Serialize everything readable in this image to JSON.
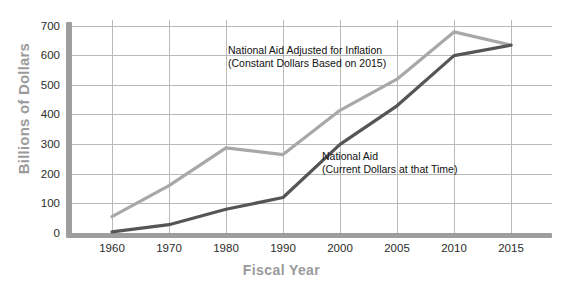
{
  "chart_data": {
    "type": "line",
    "title": "",
    "xlabel": "Fiscal Year",
    "ylabel": "Billions of Dollars",
    "categories": [
      "1960",
      "1970",
      "1980",
      "1990",
      "2000",
      "2005",
      "2010",
      "2015"
    ],
    "ylim": [
      0,
      700
    ],
    "yticks": [
      "0",
      "100",
      "200",
      "300",
      "400",
      "500",
      "600",
      "700"
    ],
    "grid": "both",
    "legend": "inline-annotations",
    "series": [
      {
        "name": "National Aid Adjusted for Inflation (Constant Dollars Based on 2015)",
        "color": "#a8a8a8",
        "values": [
          55,
          160,
          288,
          265,
          415,
          520,
          680,
          635
        ]
      },
      {
        "name": "National Aid (Current Dollars at that Time)",
        "color": "#555555",
        "values": [
          4,
          28,
          80,
          120,
          300,
          430,
          600,
          635
        ]
      }
    ],
    "annotations": [
      {
        "name": "inflation-series-label",
        "line1": "National Aid Adjusted for Inflation",
        "line2": "(Constant Dollars Based on 2015)"
      },
      {
        "name": "current-series-label",
        "line1": "National Aid",
        "line2": "(Current Dollars at that Time)"
      }
    ]
  },
  "axis": {
    "y_title": "Billions of Dollars",
    "x_title": "Fiscal Year",
    "yticks": [
      "700",
      "600",
      "500",
      "400",
      "300",
      "200",
      "100",
      "0"
    ],
    "xticks": [
      "1960",
      "1970",
      "1980",
      "1990",
      "2000",
      "2005",
      "2010",
      "2015"
    ]
  },
  "colors": {
    "inflation_line": "#a8a8a8",
    "current_line": "#555555",
    "axis_bar": "#9e9e9e",
    "gridline": "#b9b9b9",
    "axis_title": "#9a9a9a",
    "tick_text": "#2b2b2b"
  }
}
